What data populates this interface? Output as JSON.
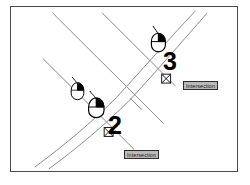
{
  "figure": {
    "kind": "cad-map-snapping-diagram",
    "background_color": "#ffffff",
    "frame_color": "#4a4a4a",
    "line_color": "#8a8a8a",
    "ink_color": "#000000",
    "label_background": "#b9b9b9",
    "label_border": "#2b2b2b"
  },
  "labels": {
    "snap_lower": "Intersection",
    "snap_upper": "Intersection"
  },
  "steps": {
    "second": "2",
    "third": "3"
  },
  "icons": {
    "mouse_left_click": "mouse-left-click-icon",
    "intersection_snap_marker": "intersection-snap-marker-icon"
  },
  "geometry": {
    "parallel_lines": [
      {
        "name": "lot-line-1",
        "x1": 42,
        "y1": 58,
        "x2": 133,
        "y2": 149
      },
      {
        "name": "lot-line-2",
        "x1": 52,
        "y1": 12,
        "x2": 163,
        "y2": 123
      },
      {
        "name": "lot-line-3",
        "x1": 102,
        "y1": 12,
        "x2": 175,
        "y2": 85
      }
    ],
    "road_curves": [
      {
        "name": "road-edge-outer",
        "points": "36,168 58,150 86,126 112,101 136,74 160,46 182,18 196,9"
      },
      {
        "name": "road-edge-inner",
        "points": "48,170 72,152 99,128 124,103 148,76 172,47 192,20 206,10"
      }
    ],
    "vertices": [
      {
        "name": "mid-vertex",
        "x": 135,
        "y": 105
      }
    ],
    "snap_points": [
      {
        "name": "snap-point-lower",
        "x": 108,
        "y": 133
      },
      {
        "name": "snap-point-upper",
        "x": 166,
        "y": 79
      }
    ]
  }
}
